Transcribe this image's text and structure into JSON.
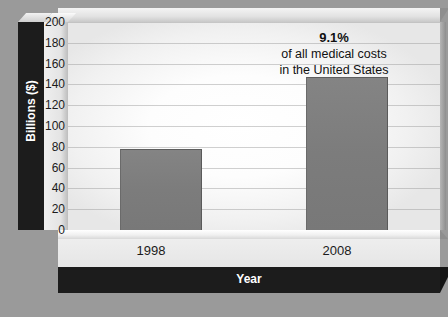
{
  "chart_data": {
    "type": "bar",
    "title": "",
    "categories": [
      "1998",
      "2008"
    ],
    "values": [
      78,
      147
    ],
    "series": [
      {
        "name": "Medical costs",
        "values": [
          78,
          147
        ]
      }
    ],
    "xlabel": "Year",
    "ylabel": "Billions ($)",
    "ylim": [
      0,
      200
    ],
    "ytick_step": 20,
    "yticks": [
      "200",
      "180",
      "160",
      "140",
      "120",
      "100",
      "80",
      "60",
      "40",
      "20",
      "0"
    ],
    "grid": true,
    "legend": "none",
    "annotations": [
      {
        "percent": "9.1%",
        "line2": "of all medical costs",
        "line3": "in the United States",
        "attached_to": "2008"
      }
    ],
    "colors": {
      "background": "#9a9a9a",
      "plot_area": "#ffffff",
      "bar_fill": "#7d7d7d",
      "axis_band": "#1c1c1c",
      "axis_band_text": "#ffffff",
      "tick_text": "#1b1b1b",
      "gridline": "#969696"
    }
  }
}
